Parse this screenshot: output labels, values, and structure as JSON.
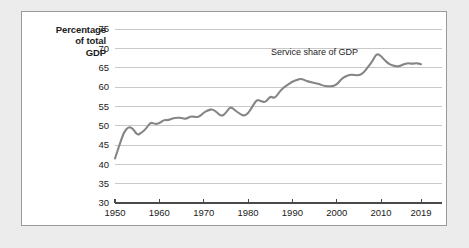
{
  "figure": {
    "background_color": "#ffffff",
    "page_background_color": "#ececed",
    "border_color": "#9a9a9a"
  },
  "axis_title": {
    "line1": "Percentage",
    "line2": "of total",
    "line3": "GDP"
  },
  "chart_data": {
    "type": "line",
    "title": "",
    "subtitle": "",
    "xlabel": "",
    "ylabel": "Percentage of total GDP",
    "xlim": [
      1950,
      2019
    ],
    "ylim": [
      30,
      75
    ],
    "grid": true,
    "grid_axis": "y",
    "legend_position": "none",
    "line_color": "#858585",
    "gridline_color": "#c3c3c3",
    "axis_color": "#4a4a4a",
    "yticks": [
      30,
      35,
      40,
      45,
      50,
      55,
      60,
      65,
      70,
      75
    ],
    "ytick_labels": [
      "30",
      "35",
      "40",
      "45",
      "50",
      "55",
      "60",
      "65",
      "70",
      "75"
    ],
    "xticks": [
      1950,
      1960,
      1970,
      1980,
      1990,
      2000,
      2010,
      2019
    ],
    "xtick_labels": [
      "1950",
      "1960",
      "1970",
      "1980",
      "1990",
      "2000",
      "2010",
      "2019"
    ],
    "annotations": [
      {
        "text": "Service share of GDP",
        "x": 1995,
        "y": 68.2
      }
    ],
    "series": [
      {
        "name": "Service share of GDP",
        "x": [
          1950,
          1951,
          1952,
          1953,
          1954,
          1955,
          1956,
          1957,
          1958,
          1959,
          1960,
          1961,
          1962,
          1963,
          1964,
          1965,
          1966,
          1967,
          1968,
          1969,
          1970,
          1971,
          1972,
          1973,
          1974,
          1975,
          1976,
          1977,
          1978,
          1979,
          1980,
          1981,
          1982,
          1983,
          1984,
          1985,
          1986,
          1987,
          1988,
          1989,
          1990,
          1991,
          1992,
          1993,
          1994,
          1995,
          1996,
          1997,
          1998,
          1999,
          2000,
          2001,
          2002,
          2003,
          2004,
          2005,
          2006,
          2007,
          2008,
          2009,
          2010,
          2011,
          2012,
          2013,
          2014,
          2015,
          2016,
          2017,
          2018,
          2019
        ],
        "values": [
          41.5,
          45.0,
          48.3,
          49.7,
          49.4,
          47.5,
          48.2,
          49.2,
          50.9,
          50.4,
          50.6,
          51.5,
          51.4,
          51.9,
          52.1,
          52.0,
          51.7,
          52.4,
          52.3,
          52.2,
          53.4,
          54.0,
          54.3,
          53.4,
          52.4,
          53.2,
          55.0,
          54.0,
          53.2,
          52.5,
          53.1,
          55.0,
          56.8,
          56.3,
          56.0,
          57.7,
          57.0,
          58.6,
          59.9,
          60.6,
          61.4,
          61.8,
          62.2,
          61.6,
          61.3,
          61.0,
          60.8,
          60.3,
          60.2,
          60.2,
          60.6,
          62.0,
          62.8,
          63.2,
          63.1,
          63.0,
          63.6,
          65.1,
          66.6,
          68.7,
          68.0,
          66.7,
          65.8,
          65.4,
          65.3,
          65.8,
          66.2,
          66.0,
          66.2,
          65.9
        ]
      }
    ]
  }
}
